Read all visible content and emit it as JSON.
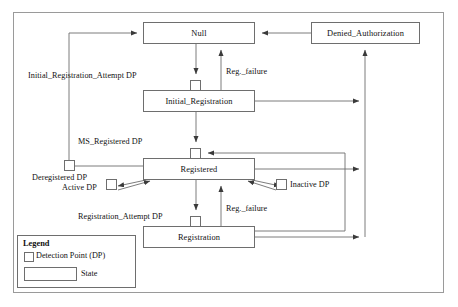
{
  "diagram": {
    "stroke_color": "#6e6e6e",
    "text_color": "#111111",
    "background": "#ffffff",
    "states": [
      {
        "id": "null",
        "label": "Null",
        "x": 143,
        "y": 22,
        "w": 112,
        "h": 22
      },
      {
        "id": "denied_authorization",
        "label": "Denied_Authorization",
        "x": 311,
        "y": 22,
        "w": 109,
        "h": 22
      },
      {
        "id": "initial_registration",
        "label": "Initial_Registration",
        "x": 143,
        "y": 90,
        "w": 112,
        "h": 22
      },
      {
        "id": "registered",
        "label": "Registered",
        "x": 143,
        "y": 158,
        "w": 112,
        "h": 22
      },
      {
        "id": "registration",
        "label": "Registration",
        "x": 143,
        "y": 226,
        "w": 112,
        "h": 22
      }
    ],
    "detection_points": [
      {
        "id": "initial_registration_attempt_dp",
        "label": "Initial_Registration_Attempt DP",
        "square_x": 190,
        "square_y": 80,
        "size": 11
      },
      {
        "id": "ms_registered_dp",
        "label": "MS_Registered DP",
        "square_x": 190,
        "square_y": 148,
        "size": 11
      },
      {
        "id": "deregistered_dp",
        "label": "Deregistered DP",
        "square_x": 64,
        "square_y": 160,
        "size": 11
      },
      {
        "id": "active_dp",
        "label": "Active DP",
        "square_x": 106,
        "square_y": 179,
        "size": 11
      },
      {
        "id": "inactive_dp",
        "label": "Inactive DP",
        "square_x": 276,
        "square_y": 179,
        "size": 11
      },
      {
        "id": "registration_attempt_dp",
        "label": "Registration_Attempt DP",
        "square_x": 190,
        "square_y": 216,
        "size": 11
      }
    ],
    "edge_labels": [
      {
        "id": "reg_failure_top",
        "label": "Reg._failure",
        "x": 226,
        "y": 67
      },
      {
        "id": "reg_failure_bottom",
        "label": "Reg._failure",
        "x": 226,
        "y": 204
      }
    ],
    "legend": {
      "title": "Legend",
      "detection_point_label": "Detection Point (DP)",
      "state_label": "State"
    }
  }
}
